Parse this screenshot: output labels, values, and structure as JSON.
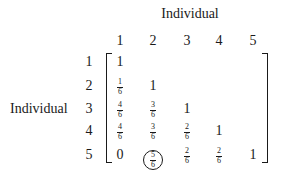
{
  "figure": {
    "column_axis_label": "Individual",
    "row_axis_label": "Individual",
    "column_headers": [
      "1",
      "2",
      "3",
      "4",
      "5"
    ],
    "row_headers": [
      "1",
      "2",
      "3",
      "4",
      "5"
    ],
    "matrix_type": "lower-triangular similarity matrix",
    "highlighted_cell": {
      "row": 5,
      "col": 2,
      "value": "5/6",
      "style": "circled"
    },
    "rows": [
      [
        {
          "n": "1"
        }
      ],
      [
        {
          "num": "1",
          "den": "6"
        },
        {
          "n": "1"
        }
      ],
      [
        {
          "num": "4",
          "den": "6"
        },
        {
          "num": "3",
          "den": "6"
        },
        {
          "n": "1"
        }
      ],
      [
        {
          "num": "4",
          "den": "6"
        },
        {
          "num": "3",
          "den": "6"
        },
        {
          "num": "2",
          "den": "6"
        },
        {
          "n": "1"
        }
      ],
      [
        {
          "n": "0"
        },
        {
          "num": "5",
          "den": "6"
        },
        {
          "num": "2",
          "den": "6"
        },
        {
          "num": "2",
          "den": "6"
        },
        {
          "n": "1"
        }
      ]
    ]
  }
}
